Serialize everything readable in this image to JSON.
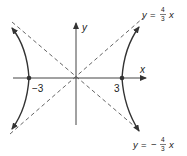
{
  "figure": {
    "type": "hyperbola",
    "equation": "x^2/9 - y^2/16 = 1",
    "colors": {
      "curve": "#333333",
      "axis": "#444444",
      "asymptote": "#555555",
      "text": "#222222"
    },
    "axes": {
      "x_label": "x",
      "y_label": "y"
    },
    "vertices": [
      {
        "label": "−3",
        "value": -3
      },
      {
        "label": "3",
        "value": 3
      }
    ],
    "asymptotes": [
      {
        "lhs": "y",
        "eq": "=",
        "sign": "",
        "num": "4",
        "den": "3",
        "var": "x",
        "slope": 1.3333
      },
      {
        "lhs": "y",
        "eq": "=",
        "sign": "−",
        "num": "4",
        "den": "3",
        "var": "x",
        "slope": -1.3333
      }
    ]
  }
}
